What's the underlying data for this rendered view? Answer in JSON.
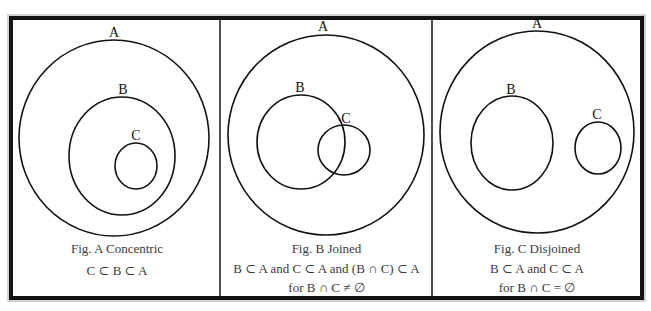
{
  "colors": {
    "border": "#141414",
    "border_highlight": "#9a9a9a",
    "stroke": "#111111",
    "caption": "#3a3a3a",
    "background": "#ffffff"
  },
  "panels": [
    {
      "id": "A",
      "title": "Fig. A Concentric",
      "lines": [
        "C ⊂ B ⊂ A"
      ],
      "circles": [
        {
          "label": "A",
          "cx": 114,
          "cy": 138,
          "rx": 95,
          "ry": 98
        },
        {
          "label": "B",
          "cx": 122,
          "cy": 156,
          "rx": 53,
          "ry": 59
        },
        {
          "label": "C",
          "cx": 136,
          "cy": 166,
          "rx": 21,
          "ry": 23
        }
      ]
    },
    {
      "id": "B",
      "title": "Fig. B Joined",
      "lines": [
        "B ⊂ A and C ⊂ A and (B ∩ C) ⊂ A",
        "for B ∩ C ≠ ∅"
      ],
      "circles": [
        {
          "label": "A",
          "cx": 326,
          "cy": 135,
          "rx": 98,
          "ry": 100
        },
        {
          "label": "B",
          "cx": 301,
          "cy": 142,
          "rx": 44,
          "ry": 47
        },
        {
          "label": "C",
          "cx": 344,
          "cy": 150,
          "rx": 26,
          "ry": 25
        }
      ]
    },
    {
      "id": "C",
      "title": "Fig. C Disjoined",
      "lines": [
        "B ⊂ A and C ⊂ A",
        "for B ∩ C = ∅"
      ],
      "circles": [
        {
          "label": "A",
          "cx": 537,
          "cy": 132,
          "rx": 97,
          "ry": 101
        },
        {
          "label": "B",
          "cx": 512,
          "cy": 143,
          "rx": 41,
          "ry": 47
        },
        {
          "label": "C",
          "cx": 598,
          "cy": 148,
          "rx": 23,
          "ry": 26
        }
      ]
    }
  ]
}
